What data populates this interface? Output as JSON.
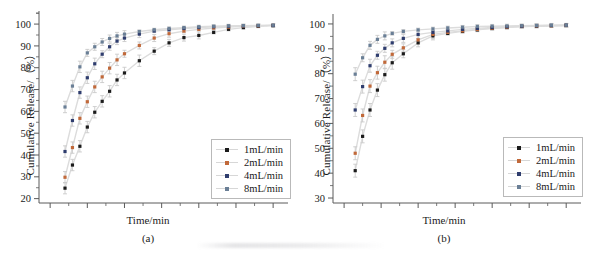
{
  "figure": {
    "width": 593,
    "height": 257,
    "background": "#ffffff"
  },
  "series_colors": {
    "1mL/min": "#1b1b1b",
    "2mL/min": "#c1693a",
    "4mL/min": "#2f3d6e",
    "8mL/min": "#6a7f96",
    "line": "#dcdcdc",
    "axis": "#5a5a5a",
    "errorbar": "#c9c9c9"
  },
  "panel_a": {
    "name": "(a)",
    "xlabel": "Time/min",
    "ylabel": "Cumulative Release/（%）",
    "legend": [
      {
        "label": "1mL/min"
      },
      {
        "label": "2mL/min"
      },
      {
        "label": "4mL/min"
      },
      {
        "label": "8mL/min"
      }
    ],
    "xticks": [
      "0",
      "5",
      "10",
      "15",
      "20",
      "25",
      "30"
    ],
    "yticks": [
      "20",
      "30",
      "40",
      "50",
      "60",
      "70",
      "80",
      "90",
      "100"
    ]
  },
  "panel_b": {
    "name": "(b)",
    "xlabel": "Time/min",
    "ylabel": "Cumulative Release/（%）",
    "legend": [
      {
        "label": "1mL/min"
      },
      {
        "label": "2mL/min"
      },
      {
        "label": "4mL/min"
      },
      {
        "label": "8mL/min"
      }
    ],
    "xticks": [
      "0",
      "5",
      "10",
      "15",
      "20",
      "25",
      "30"
    ],
    "yticks": [
      "30",
      "40",
      "50",
      "60",
      "70",
      "80",
      "90",
      "100"
    ]
  },
  "chart_data": [
    {
      "type": "line",
      "panel": "(a)",
      "title": "",
      "xlabel": "Time/min",
      "ylabel": "Cumulative Release/（%）",
      "xlim": [
        -1.5,
        32
      ],
      "ylim": [
        18,
        106
      ],
      "xticks": [
        0,
        5,
        10,
        15,
        20,
        25,
        30
      ],
      "yticks": [
        20,
        30,
        40,
        50,
        60,
        70,
        80,
        90,
        100
      ],
      "grid": false,
      "legend_position": "lower-right",
      "error_bars": true,
      "x": [
        2,
        3,
        4,
        5,
        6,
        7,
        8,
        9,
        10,
        12,
        14,
        16,
        18,
        20,
        22,
        24,
        26,
        28,
        30
      ],
      "series": [
        {
          "name": "1mL/min",
          "color": "#1b1b1b",
          "values": [
            24.8,
            35.4,
            44.0,
            52.8,
            59.6,
            64.6,
            69.2,
            74.4,
            77.6,
            83.2,
            87.6,
            91.4,
            93.8,
            94.8,
            96.2,
            97.6,
            98.4,
            99.0,
            99.3
          ]
        },
        {
          "name": "2mL/min",
          "color": "#c1693a",
          "values": [
            29.8,
            43.4,
            56.8,
            64.4,
            71.2,
            75.8,
            79.8,
            83.6,
            86.4,
            90.2,
            93.6,
            95.6,
            96.8,
            97.6,
            98.2,
            98.6,
            99.0,
            99.2,
            99.4
          ]
        },
        {
          "name": "4mL/min",
          "color": "#2f3d6e",
          "values": [
            41.6,
            55.8,
            68.6,
            75.4,
            81.8,
            86.2,
            89.6,
            92.2,
            93.6,
            95.4,
            96.8,
            97.4,
            98.0,
            98.4,
            98.8,
            99.0,
            99.2,
            99.3,
            99.4
          ]
        },
        {
          "name": "8mL/min",
          "color": "#6a7f96",
          "values": [
            62.0,
            71.6,
            80.4,
            86.8,
            89.6,
            91.8,
            93.4,
            94.6,
            95.4,
            96.6,
            97.4,
            98.0,
            98.4,
            98.8,
            99.0,
            99.2,
            99.3,
            99.4,
            99.5
          ]
        }
      ]
    },
    {
      "type": "line",
      "panel": "(b)",
      "title": "",
      "xlabel": "Time/min",
      "ylabel": "Cumulative Release/（%）",
      "xlim": [
        -1.5,
        32
      ],
      "ylim": [
        28,
        104
      ],
      "xticks": [
        0,
        5,
        10,
        15,
        20,
        25,
        30
      ],
      "yticks": [
        30,
        40,
        50,
        60,
        70,
        80,
        90,
        100
      ],
      "grid": false,
      "legend_position": "lower-right",
      "error_bars": true,
      "x": [
        1.5,
        2.5,
        3.5,
        4.5,
        5.5,
        6.5,
        8,
        10,
        12,
        14,
        16,
        18,
        20,
        22,
        24,
        26,
        28,
        30
      ],
      "series": [
        {
          "name": "1mL/min",
          "color": "#1b1b1b",
          "values": [
            41.0,
            54.8,
            65.4,
            73.4,
            79.6,
            84.4,
            88.0,
            92.4,
            95.2,
            96.2,
            97.0,
            97.6,
            98.2,
            98.6,
            99.0,
            99.1,
            99.3,
            99.4
          ]
        },
        {
          "name": "2mL/min",
          "color": "#c1693a",
          "values": [
            48.0,
            63.2,
            75.0,
            80.4,
            84.6,
            87.8,
            90.4,
            93.6,
            95.8,
            96.6,
            97.2,
            97.8,
            98.3,
            98.7,
            99.0,
            99.2,
            99.3,
            99.4
          ]
        },
        {
          "name": "4mL/min",
          "color": "#2f3d6e",
          "values": [
            65.4,
            74.8,
            83.2,
            87.4,
            90.2,
            92.4,
            94.2,
            95.8,
            96.6,
            97.2,
            97.8,
            98.2,
            98.6,
            98.9,
            99.1,
            99.3,
            99.4,
            99.5
          ]
        },
        {
          "name": "8mL/min",
          "color": "#6a7f96",
          "values": [
            79.8,
            86.4,
            91.4,
            93.8,
            95.2,
            96.2,
            97.0,
            97.6,
            98.0,
            98.4,
            98.7,
            99.0,
            99.1,
            99.2,
            99.3,
            99.4,
            99.5,
            99.5
          ]
        }
      ]
    }
  ]
}
